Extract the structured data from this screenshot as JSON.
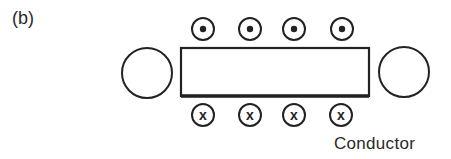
{
  "figure": {
    "panel_label": "(b)",
    "conductor_label": "Conductor",
    "colors": {
      "stroke": "#222222",
      "background": "#ffffff"
    }
  },
  "diagram": {
    "rectangle": {
      "x": 181,
      "y": 48,
      "width": 188,
      "height": 48
    },
    "side_circles": [
      {
        "name": "left-circle",
        "cx": 147,
        "cy": 73,
        "r": 25
      },
      {
        "name": "right-circle",
        "cx": 404,
        "cy": 72,
        "r": 25
      }
    ],
    "dot_symbols": [
      {
        "cx": 203,
        "cy": 29,
        "r": 11,
        "meaning": "current out of page"
      },
      {
        "cx": 250,
        "cy": 29,
        "r": 11,
        "meaning": "current out of page"
      },
      {
        "cx": 294,
        "cy": 29,
        "r": 11,
        "meaning": "current out of page"
      },
      {
        "cx": 342,
        "cy": 29,
        "r": 11,
        "meaning": "current out of page"
      }
    ],
    "cross_symbols": [
      {
        "cx": 203,
        "cy": 115,
        "r": 11,
        "glyph": "x",
        "meaning": "current into page"
      },
      {
        "cx": 250,
        "cy": 115,
        "r": 11,
        "glyph": "x",
        "meaning": "current into page"
      },
      {
        "cx": 294,
        "cy": 115,
        "r": 11,
        "glyph": "x",
        "meaning": "current into page"
      },
      {
        "cx": 341,
        "cy": 115,
        "r": 11,
        "glyph": "x",
        "meaning": "current into page"
      }
    ]
  }
}
